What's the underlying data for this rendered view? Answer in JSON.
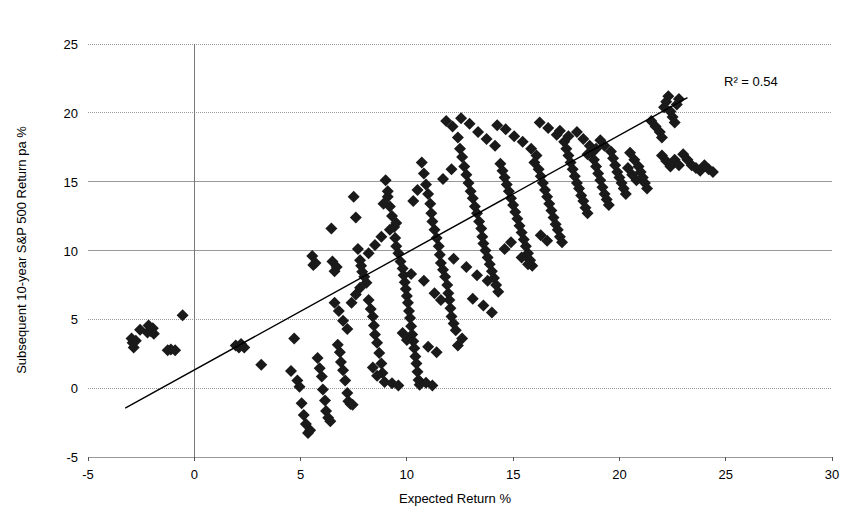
{
  "chart_data": {
    "type": "scatter",
    "title": "",
    "xlabel": "Expected Return %",
    "ylabel": "Subsequent 10-year S&P 500 Return pa %",
    "xlim": [
      -5,
      30
    ],
    "ylim": [
      -5,
      25
    ],
    "xticks": [
      -5,
      0,
      5,
      10,
      15,
      20,
      25,
      30
    ],
    "yticks": [
      -5,
      0,
      5,
      10,
      15,
      20,
      25
    ],
    "xtick_labels": [
      "-5",
      "0",
      "5",
      "10",
      "15",
      "20",
      "25",
      "30"
    ],
    "ytick_labels": [
      "-5",
      "0",
      "5",
      "10",
      "15",
      "20",
      "25"
    ],
    "grid": true,
    "grid_color": "#999999",
    "legend": false,
    "marker": "diamond",
    "marker_color": "#1a1a1a",
    "marker_size": 6,
    "annotations": [
      {
        "text": "R² = 0.54",
        "x": 22.6,
        "y": 22.4
      }
    ],
    "trendline": {
      "type": "linear",
      "color": "#000000",
      "x_start": -3.25,
      "y_start": -1.45,
      "x_end": 23.2,
      "y_end": 21.1,
      "r_squared": 0.54
    },
    "points": [
      [
        -2.95,
        3.6
      ],
      [
        -2.9,
        3.3
      ],
      [
        -2.85,
        2.95
      ],
      [
        -2.75,
        3.45
      ],
      [
        -2.55,
        4.25
      ],
      [
        -2.2,
        4.05
      ],
      [
        -2.15,
        4.55
      ],
      [
        -2.05,
        4.15
      ],
      [
        -1.95,
        4.35
      ],
      [
        -1.9,
        3.95
      ],
      [
        -1.25,
        2.75
      ],
      [
        -1.1,
        2.8
      ],
      [
        -0.9,
        2.75
      ],
      [
        -0.55,
        5.3
      ],
      [
        1.95,
        3.1
      ],
      [
        2.1,
        2.95
      ],
      [
        2.2,
        3.2
      ],
      [
        2.35,
        2.95
      ],
      [
        3.15,
        1.7
      ],
      [
        4.55,
        1.25
      ],
      [
        4.7,
        3.6
      ],
      [
        4.85,
        0.55
      ],
      [
        4.95,
        0.1
      ],
      [
        5.05,
        -1.1
      ],
      [
        5.15,
        -1.95
      ],
      [
        5.25,
        -2.6
      ],
      [
        5.35,
        -3.25
      ],
      [
        5.45,
        -3.05
      ],
      [
        5.55,
        9.6
      ],
      [
        5.6,
        8.95
      ],
      [
        5.7,
        9.1
      ],
      [
        5.8,
        2.2
      ],
      [
        5.9,
        1.45
      ],
      [
        6.0,
        0.85
      ],
      [
        6.05,
        -0.1
      ],
      [
        6.15,
        -0.9
      ],
      [
        6.2,
        -1.65
      ],
      [
        6.3,
        -2.15
      ],
      [
        6.4,
        -2.4
      ],
      [
        6.45,
        11.6
      ],
      [
        6.5,
        9.2
      ],
      [
        6.6,
        8.5
      ],
      [
        6.7,
        8.8
      ],
      [
        6.75,
        3.15
      ],
      [
        6.85,
        2.6
      ],
      [
        6.9,
        1.9
      ],
      [
        7.0,
        1.3
      ],
      [
        7.1,
        0.55
      ],
      [
        7.2,
        -0.35
      ],
      [
        7.25,
        -0.95
      ],
      [
        7.35,
        -1.15
      ],
      [
        7.45,
        -1.2
      ],
      [
        7.5,
        13.9
      ],
      [
        7.6,
        12.4
      ],
      [
        7.7,
        10.1
      ],
      [
        7.8,
        9.3
      ],
      [
        7.85,
        8.9
      ],
      [
        7.9,
        8.45
      ],
      [
        8.0,
        8.1
      ],
      [
        8.1,
        7.65
      ],
      [
        8.2,
        6.4
      ],
      [
        8.3,
        5.75
      ],
      [
        8.4,
        5.2
      ],
      [
        8.45,
        4.55
      ],
      [
        8.5,
        3.9
      ],
      [
        8.6,
        3.3
      ],
      [
        8.7,
        2.55
      ],
      [
        8.8,
        1.8
      ],
      [
        8.85,
        1.1
      ],
      [
        8.95,
        0.45
      ],
      [
        9.0,
        15.1
      ],
      [
        9.1,
        14.3
      ],
      [
        9.2,
        13.2
      ],
      [
        9.3,
        12.5
      ],
      [
        9.4,
        11.7
      ],
      [
        9.45,
        10.9
      ],
      [
        9.5,
        10.3
      ],
      [
        9.6,
        9.8
      ],
      [
        9.7,
        9.2
      ],
      [
        9.8,
        8.7
      ],
      [
        9.85,
        8.2
      ],
      [
        9.9,
        7.7
      ],
      [
        9.95,
        7.2
      ],
      [
        10.0,
        6.7
      ],
      [
        10.05,
        6.2
      ],
      [
        10.1,
        5.6
      ],
      [
        10.15,
        5.1
      ],
      [
        10.2,
        4.5
      ],
      [
        10.25,
        3.9
      ],
      [
        10.3,
        3.4
      ],
      [
        10.35,
        2.9
      ],
      [
        10.4,
        2.3
      ],
      [
        10.45,
        1.8
      ],
      [
        10.5,
        1.2
      ],
      [
        10.55,
        0.6
      ],
      [
        10.6,
        0.25
      ],
      [
        10.7,
        16.4
      ],
      [
        10.8,
        15.6
      ],
      [
        10.9,
        14.8
      ],
      [
        11.0,
        14.1
      ],
      [
        11.1,
        13.4
      ],
      [
        11.15,
        12.7
      ],
      [
        11.2,
        12.1
      ],
      [
        11.3,
        11.5
      ],
      [
        11.4,
        10.9
      ],
      [
        11.5,
        10.3
      ],
      [
        11.55,
        9.7
      ],
      [
        11.6,
        9.1
      ],
      [
        11.7,
        8.6
      ],
      [
        11.8,
        8.1
      ],
      [
        11.9,
        7.5
      ],
      [
        11.95,
        6.9
      ],
      [
        12.0,
        6.4
      ],
      [
        12.05,
        5.8
      ],
      [
        12.1,
        5.2
      ],
      [
        12.2,
        4.7
      ],
      [
        12.3,
        4.2
      ],
      [
        12.4,
        18.2
      ],
      [
        12.5,
        17.4
      ],
      [
        12.6,
        16.8
      ],
      [
        12.7,
        16.1
      ],
      [
        12.8,
        15.5
      ],
      [
        12.9,
        14.9
      ],
      [
        13.0,
        14.3
      ],
      [
        13.1,
        13.8
      ],
      [
        13.2,
        13.2
      ],
      [
        13.3,
        12.7
      ],
      [
        13.4,
        12.1
      ],
      [
        13.5,
        11.6
      ],
      [
        13.55,
        11.0
      ],
      [
        13.6,
        10.5
      ],
      [
        13.7,
        10.0
      ],
      [
        13.8,
        9.5
      ],
      [
        13.9,
        9.0
      ],
      [
        14.0,
        8.5
      ],
      [
        14.1,
        8.0
      ],
      [
        14.2,
        7.5
      ],
      [
        14.3,
        7.0
      ],
      [
        11.85,
        19.4
      ],
      [
        12.15,
        19.0
      ],
      [
        12.55,
        19.6
      ],
      [
        12.95,
        19.2
      ],
      [
        13.35,
        18.6
      ],
      [
        13.75,
        18.1
      ],
      [
        14.15,
        17.6
      ],
      [
        14.4,
        16.3
      ],
      [
        14.5,
        15.8
      ],
      [
        14.6,
        15.3
      ],
      [
        14.7,
        14.8
      ],
      [
        14.8,
        14.3
      ],
      [
        14.9,
        13.8
      ],
      [
        15.0,
        13.3
      ],
      [
        15.1,
        12.8
      ],
      [
        15.2,
        12.3
      ],
      [
        15.3,
        11.8
      ],
      [
        15.4,
        11.3
      ],
      [
        15.5,
        10.8
      ],
      [
        15.6,
        10.3
      ],
      [
        15.7,
        9.8
      ],
      [
        15.8,
        9.3
      ],
      [
        15.9,
        8.9
      ],
      [
        14.25,
        19.1
      ],
      [
        14.65,
        18.8
      ],
      [
        15.05,
        18.3
      ],
      [
        15.45,
        17.9
      ],
      [
        15.85,
        17.4
      ],
      [
        16.1,
        16.9
      ],
      [
        16.0,
        16.4
      ],
      [
        16.2,
        15.9
      ],
      [
        16.3,
        15.4
      ],
      [
        16.4,
        14.9
      ],
      [
        16.5,
        14.4
      ],
      [
        16.6,
        13.9
      ],
      [
        16.7,
        13.4
      ],
      [
        16.8,
        12.9
      ],
      [
        16.9,
        12.4
      ],
      [
        17.0,
        11.9
      ],
      [
        17.1,
        11.5
      ],
      [
        17.2,
        11.0
      ],
      [
        17.3,
        10.6
      ],
      [
        16.25,
        19.3
      ],
      [
        16.65,
        18.9
      ],
      [
        17.05,
        18.4
      ],
      [
        17.4,
        17.9
      ],
      [
        17.5,
        17.4
      ],
      [
        17.6,
        16.9
      ],
      [
        17.7,
        16.4
      ],
      [
        17.8,
        15.9
      ],
      [
        17.9,
        15.4
      ],
      [
        18.0,
        14.9
      ],
      [
        18.1,
        14.5
      ],
      [
        18.2,
        14.0
      ],
      [
        18.3,
        13.6
      ],
      [
        18.4,
        13.1
      ],
      [
        18.5,
        12.7
      ],
      [
        18.0,
        18.6
      ],
      [
        18.3,
        18.1
      ],
      [
        18.6,
        17.6
      ],
      [
        18.7,
        17.1
      ],
      [
        18.8,
        16.6
      ],
      [
        18.9,
        16.1
      ],
      [
        19.0,
        15.6
      ],
      [
        19.1,
        15.1
      ],
      [
        19.2,
        14.6
      ],
      [
        19.3,
        14.1
      ],
      [
        19.4,
        13.7
      ],
      [
        19.5,
        13.3
      ],
      [
        19.6,
        17.2
      ],
      [
        19.7,
        16.7
      ],
      [
        19.8,
        16.2
      ],
      [
        19.9,
        15.7
      ],
      [
        20.0,
        15.3
      ],
      [
        20.1,
        14.9
      ],
      [
        20.2,
        14.5
      ],
      [
        20.3,
        14.1
      ],
      [
        20.5,
        17.1
      ],
      [
        20.7,
        16.6
      ],
      [
        20.9,
        16.1
      ],
      [
        21.0,
        15.7
      ],
      [
        21.1,
        15.3
      ],
      [
        21.2,
        14.9
      ],
      [
        21.3,
        14.5
      ],
      [
        21.5,
        19.4
      ],
      [
        21.7,
        19.0
      ],
      [
        21.9,
        18.6
      ],
      [
        22.0,
        18.2
      ],
      [
        22.1,
        20.4
      ],
      [
        22.2,
        20.8
      ],
      [
        22.3,
        21.2
      ],
      [
        22.4,
        20.1
      ],
      [
        22.5,
        19.7
      ],
      [
        22.6,
        19.3
      ],
      [
        22.7,
        20.6
      ],
      [
        22.8,
        21.0
      ],
      [
        22.0,
        16.9
      ],
      [
        22.2,
        16.5
      ],
      [
        22.4,
        16.1
      ],
      [
        22.6,
        16.6
      ],
      [
        22.8,
        16.2
      ],
      [
        23.0,
        17.0
      ],
      [
        23.2,
        16.6
      ],
      [
        23.4,
        16.2
      ],
      [
        23.6,
        16.0
      ],
      [
        23.8,
        15.8
      ],
      [
        24.0,
        16.2
      ],
      [
        24.2,
        15.9
      ],
      [
        24.4,
        15.7
      ],
      [
        20.4,
        16.0
      ],
      [
        20.6,
        15.5
      ],
      [
        20.8,
        15.1
      ],
      [
        19.1,
        18.0
      ],
      [
        19.3,
        17.6
      ],
      [
        17.2,
        18.7
      ],
      [
        17.6,
        18.3
      ],
      [
        18.5,
        17.0
      ],
      [
        18.9,
        17.4
      ],
      [
        13.1,
        6.5
      ],
      [
        13.6,
        6.0
      ],
      [
        14.0,
        5.5
      ],
      [
        12.6,
        3.6
      ],
      [
        12.4,
        3.1
      ],
      [
        11.0,
        3.0
      ],
      [
        11.4,
        2.6
      ],
      [
        10.9,
        0.4
      ],
      [
        11.2,
        0.2
      ],
      [
        9.3,
        0.35
      ],
      [
        9.6,
        0.2
      ],
      [
        8.2,
        9.8
      ],
      [
        8.5,
        10.4
      ],
      [
        8.8,
        11.0
      ],
      [
        9.2,
        11.5
      ],
      [
        9.5,
        12.0
      ],
      [
        7.4,
        6.2
      ],
      [
        7.6,
        6.8
      ],
      [
        7.8,
        7.3
      ],
      [
        8.9,
        13.4
      ],
      [
        9.1,
        13.9
      ],
      [
        10.3,
        13.6
      ],
      [
        10.5,
        14.4
      ],
      [
        11.7,
        15.2
      ],
      [
        12.1,
        15.9
      ],
      [
        16.3,
        11.1
      ],
      [
        16.6,
        10.7
      ],
      [
        15.4,
        9.5
      ],
      [
        15.7,
        9.0
      ],
      [
        14.6,
        10.1
      ],
      [
        14.9,
        10.6
      ],
      [
        13.3,
        8.2
      ],
      [
        13.8,
        7.8
      ],
      [
        12.8,
        8.8
      ],
      [
        12.2,
        9.4
      ],
      [
        11.3,
        6.9
      ],
      [
        11.6,
        6.4
      ],
      [
        10.8,
        7.8
      ],
      [
        10.2,
        8.3
      ],
      [
        9.8,
        4.0
      ],
      [
        10.0,
        3.5
      ],
      [
        8.6,
        0.9
      ],
      [
        8.4,
        1.5
      ],
      [
        7.2,
        4.3
      ],
      [
        7.0,
        4.9
      ],
      [
        6.8,
        5.6
      ],
      [
        6.6,
        6.2
      ]
    ]
  }
}
